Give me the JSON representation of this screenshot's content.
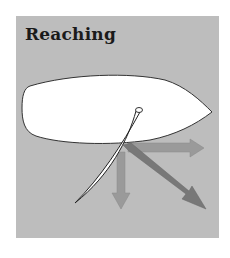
{
  "title": "Reaching",
  "colors": {
    "background": "#ffffff",
    "panel": "#bdbdbd",
    "hull": "#ffffff",
    "outline": "#333333",
    "arrow_light": "#9a9a9a",
    "arrow_dark": "#7a7a7a"
  },
  "diagram": {
    "elements": [
      "hull",
      "mast",
      "sail",
      "forward-arrow",
      "sideways-arrow",
      "resultant-arrow"
    ]
  }
}
